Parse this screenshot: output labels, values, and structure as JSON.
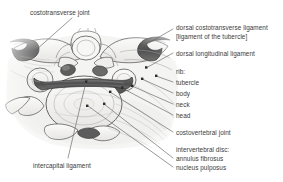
{
  "figure": {
    "kind": "anatomical-illustration",
    "border_color": "#d8d8d8",
    "background": "#ffffff",
    "text_color": "#3b3b3b",
    "ligament_fill_dark": "#5a5a5a",
    "ligament_fill_mid": "#8d8d8d",
    "bone_fill": "#f2f1ef",
    "outline_color": "#4a4a4a"
  },
  "labels": {
    "costotransverse_joint": "costotransverse joint",
    "intercapital_ligament": "intercapital ligament",
    "dorsal_costotransverse_ligament": "dorsal costotransverse ligament",
    "dorsal_costotransverse_ligament_alt": "[ligament of the tubercle]",
    "dorsal_longitudinal_ligament": "dorsal longitudinal ligament",
    "rib": "rib:",
    "tubercle": "tubercle",
    "body": "body",
    "neck": "neck",
    "head": "head",
    "costovertebral_joint": "costovertebral joint",
    "intervertebral_disc": "intervertebral disc:",
    "annulus_fibrosus": "annulus fibrosus",
    "nucleus_pulposus": "nucleus pulposus"
  }
}
